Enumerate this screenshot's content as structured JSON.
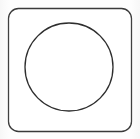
{
  "figure": {
    "title": "Circle inscribed in a rounded square",
    "background_color": "#fdfdfd",
    "stroke_color": "#333333",
    "fill_color": "#ffffff",
    "canvas": {
      "width": 140,
      "height": 139
    },
    "shapes": [
      {
        "name": "rounded-square",
        "type": "rounded-rect",
        "x": 8.5,
        "y": 8.5,
        "width": 123,
        "height": 123,
        "corner_radius": 10,
        "stroke_width": 1.3,
        "stroke_color": "#3a3a3a",
        "fill": "#ffffff"
      },
      {
        "name": "inscribed-circle",
        "type": "circle",
        "center_x": 69,
        "center_y": 67,
        "radius": 44,
        "stroke_width": 1.3,
        "stroke_color": "#2e2e2e",
        "fill": "none"
      }
    ]
  }
}
